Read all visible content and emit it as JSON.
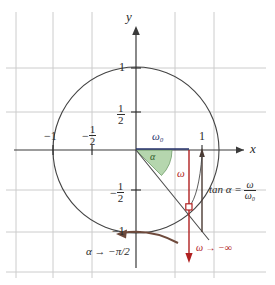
{
  "figure": {
    "type": "unit-circle-phase-diagram",
    "axes": {
      "x_label": "x",
      "y_label": "y",
      "x_ticks": [
        {
          "value": -1,
          "label": "−1",
          "kind": "plain"
        },
        {
          "value": -0.5,
          "label": "−1/2",
          "kind": "fraction",
          "sign": "−",
          "num": "1",
          "den": "2"
        },
        {
          "value": 1,
          "label": "1",
          "kind": "plain"
        }
      ],
      "y_ticks": [
        {
          "value": 1,
          "label": "1",
          "kind": "plain"
        },
        {
          "value": 0.5,
          "label": "1/2",
          "kind": "fraction",
          "sign": "",
          "num": "1",
          "den": "2"
        },
        {
          "value": -0.5,
          "label": "−1/2",
          "kind": "fraction",
          "sign": "−",
          "num": "1",
          "den": "2"
        },
        {
          "value": -1,
          "label": "−1",
          "kind": "plain"
        }
      ],
      "xlim": [
        -1.45,
        1.35
      ],
      "ylim": [
        -1.55,
        1.35
      ],
      "grid": true
    },
    "annotations": {
      "omega0": "ω₀",
      "omega": "ω",
      "alpha": "α",
      "tan_lhs": "tan α =",
      "tan_num": "ω",
      "tan_den": "ω₀",
      "alpha_limit": "α → −π/2",
      "omega_limit": "ω → −∞"
    },
    "elements": {
      "unit_circle": "unit-circle",
      "radius_line": "radius-to-point",
      "omega0_segment": "omega0-horizontal-segment",
      "omega_arrow": "omega-downward-arrow",
      "tan_segment": "tangent-vertical-segment",
      "angle_sector": "alpha-angle-sector",
      "point_marker": "intersection-point-marker",
      "curved_arrow": "alpha-rotation-curved-arrow"
    },
    "colors": {
      "grid": "#cccccc",
      "axis": "#3a3a3a",
      "circle": "#444444",
      "red": "#b02020",
      "navy": "#24306a",
      "green_fill": "#a8cfa0",
      "green_stroke": "#6f9c68",
      "brown": "#6e4a3c",
      "text": "#2a2a2a"
    }
  }
}
